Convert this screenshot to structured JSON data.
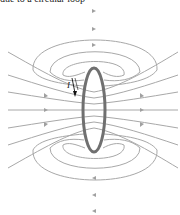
{
  "caption": {
    "text": "due to a circular loop"
  },
  "diagram": {
    "current_label": "I",
    "colors": {
      "field_line": "#a8a8a8",
      "loop": "#707070",
      "current_arrow": "#111111",
      "background": "#ffffff"
    },
    "loop": {
      "cx": 94,
      "cy": 110,
      "rx": 11,
      "ry": 42
    },
    "field_lines": {
      "top_loops": 3,
      "bottom_loops": 3,
      "through_lines": 9
    }
  }
}
